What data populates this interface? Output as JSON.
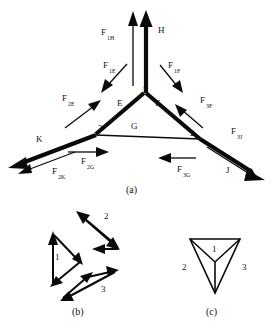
{
  "figure": {
    "title_caption_a": "(a)",
    "title_caption_b": "(b)",
    "title_caption_c": "(c)"
  },
  "panel_a": {
    "members": [
      {
        "name": "H",
        "label": "H",
        "label_x": 160,
        "label_y": 32,
        "description": "vertical top member"
      },
      {
        "name": "E",
        "label": "E",
        "label_x": 118,
        "label_y": 105,
        "description": "left upper chord"
      },
      {
        "name": "F",
        "label": "F",
        "label_x": 155,
        "label_y": 105,
        "description": "right upper chord"
      },
      {
        "name": "G",
        "label": "G",
        "label_x": 133,
        "label_y": 128,
        "description": "bottom horizontal chord"
      },
      {
        "name": "K",
        "label": "K",
        "label_x": 38,
        "label_y": 141,
        "description": "lower left member"
      },
      {
        "name": "J",
        "label": "J",
        "label_x": 228,
        "label_y": 172,
        "description": "lower right member"
      }
    ],
    "nodes": [
      {
        "id": "1",
        "label": "1",
        "x": 142,
        "y": 93
      },
      {
        "id": "2",
        "label": "2",
        "x": 196,
        "y": 135
      },
      {
        "id": "3",
        "label": "3",
        "x": 100,
        "y": 131
      }
    ],
    "forces": [
      {
        "name": "F1H",
        "base": "F",
        "sub": "1H",
        "label_x": 104,
        "label_y": 36,
        "dir": "up"
      },
      {
        "name": "F1E",
        "base": "F",
        "sub": "1E",
        "label_x": 105,
        "label_y": 70,
        "dir": "down-left"
      },
      {
        "name": "F1F",
        "base": "F",
        "sub": "1F",
        "label_x": 172,
        "label_y": 70,
        "dir": "down-right"
      },
      {
        "name": "F2E",
        "base": "F",
        "sub": "2E",
        "label_x": 65,
        "label_y": 103,
        "dir": "up-right"
      },
      {
        "name": "F3F",
        "base": "F",
        "sub": "3F",
        "label_x": 203,
        "label_y": 105,
        "dir": "up-left"
      },
      {
        "name": "F2K",
        "base": "F",
        "sub": "2K",
        "label_x": 55,
        "label_y": 176,
        "dir": "down-left"
      },
      {
        "name": "F3J",
        "base": "F",
        "sub": "3J",
        "label_x": 234,
        "label_y": 136,
        "dir": "down-right"
      },
      {
        "name": "F2G",
        "base": "F",
        "sub": "2G",
        "label_x": 84,
        "label_y": 165,
        "dir": "right"
      },
      {
        "name": "F3G",
        "base": "F",
        "sub": "3G",
        "label_x": 180,
        "label_y": 173,
        "dir": "left"
      }
    ]
  },
  "panel_b": {
    "triangles": [
      {
        "id": "1",
        "label": "1",
        "label_x": 57,
        "label_y": 258
      },
      {
        "id": "2",
        "label": "2",
        "label_x": 106,
        "label_y": 217
      },
      {
        "id": "3",
        "label": "3",
        "label_x": 103,
        "label_y": 290
      }
    ]
  },
  "panel_c": {
    "regions": [
      {
        "id": "1",
        "label": "1",
        "label_x": 214,
        "label_y": 250
      },
      {
        "id": "2",
        "label": "2",
        "label_x": 186,
        "label_y": 268
      },
      {
        "id": "3",
        "label": "3",
        "label_x": 241,
        "label_y": 268
      }
    ]
  }
}
